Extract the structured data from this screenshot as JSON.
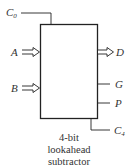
{
  "diagram": {
    "block": {
      "caption_lines": [
        "4-bit",
        "lookahead",
        "subtractor"
      ]
    },
    "inputs": [
      {
        "name": "C",
        "subscript": "0",
        "type": "line"
      },
      {
        "name": "A",
        "type": "bus-arrow"
      },
      {
        "name": "B",
        "type": "bus-arrow"
      }
    ],
    "outputs": [
      {
        "name": "D",
        "type": "bus-arrow"
      },
      {
        "name": "G",
        "type": "line"
      },
      {
        "name": "P",
        "type": "line"
      },
      {
        "name": "C",
        "subscript": "4",
        "type": "line"
      }
    ],
    "colors": {
      "line": "#222222",
      "text": "#333333",
      "background": "#ffffff"
    }
  }
}
